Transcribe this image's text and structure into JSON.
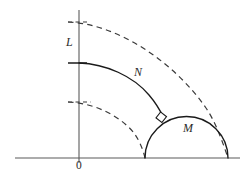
{
  "figure": {
    "background_color": "#ffffff",
    "width": 249,
    "height": 181,
    "labels": {
      "vertical_axis_label": "L",
      "solid_arc_label": "N",
      "semicircle_label": "M",
      "origin_label": "0"
    },
    "colors": {
      "axis": "#5b5b5b",
      "solid_curve": "#1a1a1a",
      "dashed_curve": "#3a3a3a",
      "label_text": "#2a2a2a"
    },
    "geometry": {
      "origin": {
        "x": 79,
        "y": 158
      },
      "x_axis": {
        "x1": 15,
        "y1": 158,
        "x2": 240,
        "y2": 158
      },
      "y_axis": {
        "x1": 79,
        "y1": 10,
        "x2": 79,
        "y2": 163
      },
      "arc_N": {
        "type": "solid",
        "start": {
          "x": 79,
          "y": 63
        },
        "end": {
          "x": 163,
          "y": 119
        },
        "radius": 150,
        "note": "solid quarter-arc from vertical axis to tangency point on semicircle M"
      },
      "arc_outer_dashed": {
        "type": "dashed",
        "start": {
          "x": 68,
          "y": 22
        },
        "end": {
          "x": 228,
          "y": 158
        },
        "radius": 210,
        "note": "outer dashed arc meeting x-axis at right endpoint of M"
      },
      "arc_inner_dashed": {
        "type": "dashed",
        "start": {
          "x": 68,
          "y": 102
        },
        "end": {
          "x": 145,
          "y": 158
        },
        "radius": 78,
        "note": "inner dashed arc meeting x-axis at left endpoint of M"
      },
      "semicircle_M": {
        "type": "solid",
        "left_end": {
          "x": 145,
          "y": 158
        },
        "right_end": {
          "x": 228,
          "y": 158
        },
        "center": {
          "x": 186.5,
          "y": 158
        },
        "radius": 41.5,
        "apex": {
          "x": 186.5,
          "y": 116.5
        }
      },
      "right_angle_marker": {
        "x": 160,
        "y": 117,
        "size": 7,
        "note": "square marker indicating perpendicular intersection of arc N and semicircle M"
      },
      "tick_on_y_axis_solid": {
        "x1": 68,
        "y1": 63,
        "x2": 86,
        "y2": 63
      },
      "tick_on_y_axis_outer_dashed": {
        "x1": 68,
        "y1": 22,
        "x2": 88,
        "y2": 22
      },
      "tick_on_y_axis_inner_dashed": {
        "x1": 68,
        "y1": 102,
        "x2": 90,
        "y2": 102
      }
    }
  }
}
